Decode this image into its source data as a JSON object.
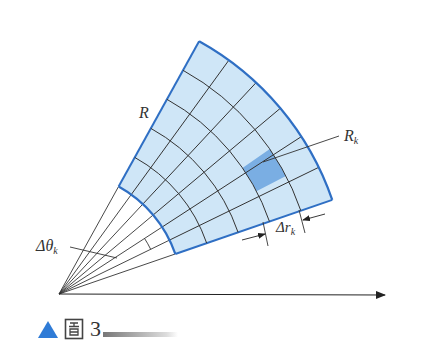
{
  "diagram": {
    "labels": {
      "region": "R",
      "subregion_base": "R",
      "subregion_sub": "k",
      "delta_theta_base": "Δθ",
      "delta_theta_sub": "k",
      "delta_r_base": "Δr",
      "delta_r_sub": "k"
    },
    "geometry": {
      "origin": [
        59,
        294
      ],
      "r_inner": 123,
      "r_outer": 289,
      "theta_min_deg": 19,
      "theta_max_deg": 61,
      "rings": 5,
      "sectors": 6,
      "highlighted_cell": {
        "ring": 4,
        "sector": 2
      }
    },
    "colors": {
      "region_fill": "#cfe6f7",
      "highlight_fill": "#7aaee3",
      "boundary": "#2f6fc4",
      "grid": "#333333",
      "axis": "#222222"
    }
  },
  "caption": {
    "marker": "▲",
    "char": "图",
    "number": "3"
  }
}
